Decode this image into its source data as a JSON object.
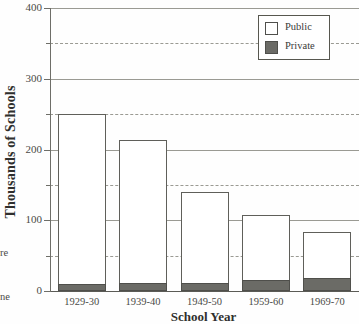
{
  "chart_data": {
    "type": "bar",
    "stacked": true,
    "title": "",
    "xlabel": "School Year",
    "ylabel": "Thousands of Schools",
    "categories": [
      "1929-30",
      "1939-40",
      "1949-50",
      "1959-60",
      "1969-70"
    ],
    "series": [
      {
        "name": "Private",
        "values": [
          10,
          12,
          12,
          16,
          18
        ],
        "color": "#6b6b66"
      },
      {
        "name": "Public",
        "values": [
          240,
          201,
          128,
          91,
          65
        ],
        "color": "#ffffff"
      }
    ],
    "totals": [
      250,
      213,
      140,
      107,
      83
    ],
    "ylim": [
      0,
      400
    ],
    "yticks": [
      0,
      100,
      200,
      300,
      400
    ],
    "yticklabels": [
      "0",
      "100",
      "200",
      "300",
      "400"
    ],
    "yminorticks": [
      50,
      150,
      250,
      350
    ],
    "grid": "horizontal-major-solid-minor-dashed",
    "legend_position": "top-right"
  },
  "legend": {
    "items": [
      {
        "label": "Public",
        "swatch": "public-swatch"
      },
      {
        "label": "Private",
        "swatch": "private-swatch"
      }
    ]
  },
  "margin_fragments": [
    {
      "text": "re"
    },
    {
      "text": "ne"
    }
  ],
  "colors": {
    "private_fill": "#6b6b66",
    "public_fill": "#ffffff",
    "gridline": "#9a9a93",
    "axis": "#6e6e68",
    "text": "#3a3a38"
  }
}
